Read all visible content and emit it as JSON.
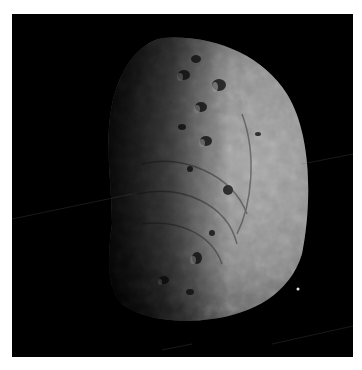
{
  "image": {
    "subject": "asteroid",
    "background_color": "#000000",
    "page_color": "#ffffff",
    "surface_color": "#9a9a9a",
    "shadow_color": "#1a1a1a"
  }
}
